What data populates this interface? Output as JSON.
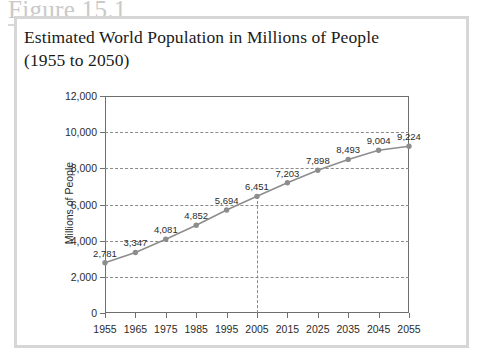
{
  "figure": {
    "number_label": "Figure 15.1",
    "title": "Estimated World Population in Millions of People\n(1955 to 2050)",
    "border_color": "#d6d6d6",
    "label_color": "#c9c9c9"
  },
  "chart_data": {
    "type": "line",
    "title": "Estimated World Population in Millions of People (1955 to 2050)",
    "xlabel": "",
    "ylabel": "Millions of People",
    "categories": [
      1955,
      1965,
      1975,
      1985,
      1995,
      2005,
      2015,
      2025,
      2035,
      2045,
      2055
    ],
    "x_tick_labels": [
      "1955",
      "1965",
      "1975",
      "1985",
      "1995",
      "2005",
      "2015",
      "2025",
      "2035",
      "2045",
      "2055"
    ],
    "values": [
      2781,
      3347,
      4081,
      4852,
      5694,
      6451,
      7203,
      7898,
      8493,
      9004,
      9224
    ],
    "point_labels": [
      "2,781",
      "3,347",
      "4,081",
      "4,852",
      "5,694",
      "6,451",
      "7,203",
      "7,898",
      "8,493",
      "9,004",
      "9,224"
    ],
    "ylim": [
      0,
      12000
    ],
    "y_ticks": [
      0,
      2000,
      4000,
      6000,
      8000,
      10000,
      12000
    ],
    "y_tick_labels": [
      "0",
      "2,000",
      "4,000",
      "6,000",
      "8,000",
      "10,000",
      "12,000"
    ],
    "xlim": [
      1955,
      2055
    ],
    "grid": "horizontal-dashed",
    "legend": "none",
    "series_color": "#8d8d8d",
    "marker": "circle",
    "annotations": [
      {
        "name": "reference-line-2005",
        "type": "vertical-dashed",
        "x": 2005,
        "from_y": 0,
        "to_y": 6451
      }
    ]
  }
}
